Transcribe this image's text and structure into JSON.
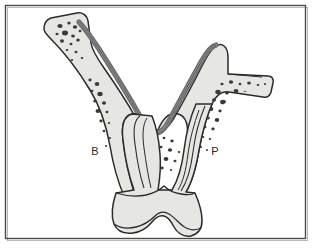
{
  "figure": {
    "domain": "diagram",
    "kind": "anatomical-cross-section",
    "background_color": "#ffffff",
    "frame": {
      "border_color_dark": "#4a4a4a",
      "border_color_light": "#b9b9b9",
      "inset_left": 6,
      "inset_top": 6,
      "inset_right": 9,
      "inset_bottom": 9
    },
    "palette": {
      "bone_fill": "#e6e6e3",
      "tooth_fill": "#e6e6e3",
      "outline": "#2b2b2b",
      "cortical_band": "#6e6e6e",
      "cortical_band_inner": "#9a9a9a",
      "trabecula_speckle": "#3a3a3a",
      "label_color": "#2b2b2b"
    },
    "labels": [
      {
        "id": "buccal",
        "text": "B",
        "x": 95,
        "y": 155,
        "meaning": "Buccal"
      },
      {
        "id": "palatal",
        "text": "P",
        "x": 215,
        "y": 155,
        "meaning": "Palatal"
      }
    ],
    "structures": [
      {
        "id": "alveolar-bone",
        "name": "alveolar bone (speckled trabecular body)"
      },
      {
        "id": "cortical-band",
        "name": "cortical plate / mucosal lining band"
      },
      {
        "id": "left-ramus",
        "name": "upper-left bone branch"
      },
      {
        "id": "right-vertical-ramus",
        "name": "upper-right bone branch"
      },
      {
        "id": "right-horizontal-ramus",
        "name": "right horizontal bone branch"
      },
      {
        "id": "interdental-trough",
        "name": "central U-shaped interdental trough"
      },
      {
        "id": "tooth-root-mesial",
        "name": "mesial tooth root"
      },
      {
        "id": "tooth-root-distal",
        "name": "distal tooth root"
      },
      {
        "id": "tooth-crown",
        "name": "tooth crown with bilobed occlusal surface"
      },
      {
        "id": "pulp-canal",
        "name": "root canal / pulp outline"
      }
    ]
  }
}
